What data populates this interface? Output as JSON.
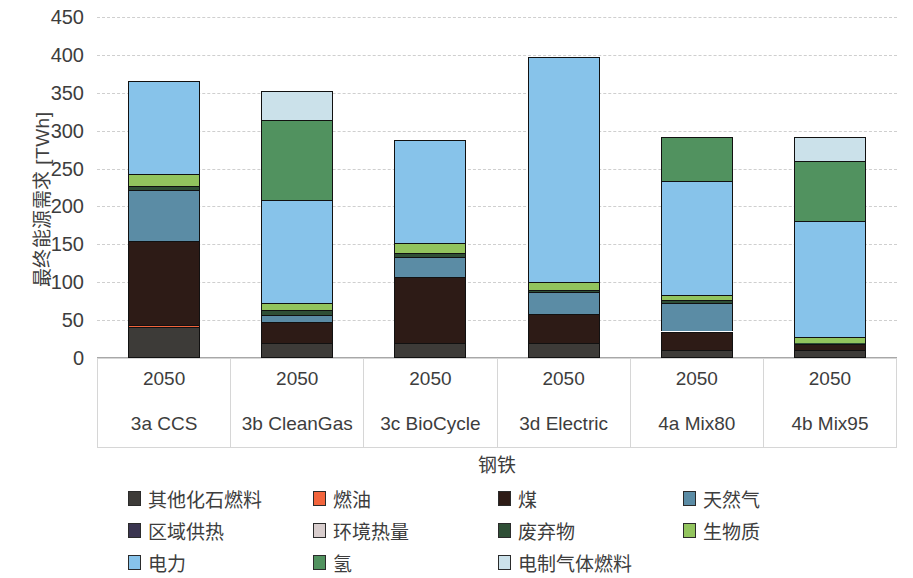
{
  "chart_data": {
    "type": "bar",
    "stacked": true,
    "title": "",
    "xlabel": "钢铁",
    "ylabel": "最终能源需求 [TWh]",
    "ylim": [
      0,
      450
    ],
    "ytick_step": 50,
    "yticks": [
      "450",
      "400",
      "350",
      "300",
      "250",
      "200",
      "150",
      "100",
      "50",
      "0"
    ],
    "grid": true,
    "legend_position": "bottom",
    "categories": [
      "3a CCS",
      "3b CleanGas",
      "3c BioCycle",
      "3d Electric",
      "4a Mix80",
      "4b Mix95"
    ],
    "category_years": [
      "2050",
      "2050",
      "2050",
      "2050",
      "2050",
      "2050"
    ],
    "series": [
      {
        "name": "其他化石燃料",
        "color": "#3d3b38",
        "values": [
          41,
          20,
          20,
          20,
          11,
          10
        ]
      },
      {
        "name": "燃油",
        "color": "#f2643c",
        "values": [
          2,
          0,
          0,
          0,
          0,
          0
        ]
      },
      {
        "name": "煤",
        "color": "#2d1b16",
        "values": [
          112,
          28,
          87,
          38,
          24,
          8
        ]
      },
      {
        "name": "天然气",
        "color": "#5b8ca5",
        "values": [
          67,
          9,
          26,
          29,
          38,
          0
        ]
      },
      {
        "name": "区域供热",
        "color": "#3a3550",
        "values": [
          0,
          0,
          0,
          0,
          0,
          0
        ]
      },
      {
        "name": "环境热量",
        "color": "#d8cdcd",
        "values": [
          0,
          0,
          0,
          0,
          0,
          0
        ]
      },
      {
        "name": "废弃物",
        "color": "#2f4f36",
        "values": [
          5,
          6,
          5,
          3,
          3,
          2
        ]
      },
      {
        "name": "生物质",
        "color": "#92c45e",
        "values": [
          16,
          10,
          14,
          10,
          7,
          8
        ]
      },
      {
        "name": "电力",
        "color": "#87c3ea",
        "values": [
          122,
          135,
          136,
          297,
          150,
          153
        ]
      },
      {
        "name": "氢",
        "color": "#51925f",
        "values": [
          0,
          106,
          0,
          0,
          59,
          79
        ]
      },
      {
        "name": "电制气体燃料",
        "color": "#cbe1ea",
        "values": [
          0,
          39,
          0,
          0,
          0,
          32
        ]
      }
    ],
    "totals": [
      "365",
      "353",
      "288",
      "397",
      "292",
      "292"
    ]
  },
  "legend": {
    "items": [
      {
        "label": "其他化石燃料",
        "color": "#3d3b38",
        "icon": "legend-swatch"
      },
      {
        "label": "燃油",
        "color": "#f2643c",
        "icon": "legend-swatch"
      },
      {
        "label": "煤",
        "color": "#2d1b16",
        "icon": "legend-swatch"
      },
      {
        "label": "天然气",
        "color": "#5b8ca5",
        "icon": "legend-swatch"
      },
      {
        "label": "区域供热",
        "color": "#3a3550",
        "icon": "legend-swatch"
      },
      {
        "label": "环境热量",
        "color": "#d8cdcd",
        "icon": "legend-swatch"
      },
      {
        "label": "废弃物",
        "color": "#2f4f36",
        "icon": "legend-swatch"
      },
      {
        "label": "生物质",
        "color": "#92c45e",
        "icon": "legend-swatch"
      },
      {
        "label": "电力",
        "color": "#87c3ea",
        "icon": "legend-swatch"
      },
      {
        "label": "氢",
        "color": "#51925f",
        "icon": "legend-swatch"
      },
      {
        "label": "电制气体燃料",
        "color": "#cbe1ea",
        "icon": "legend-swatch"
      }
    ]
  }
}
